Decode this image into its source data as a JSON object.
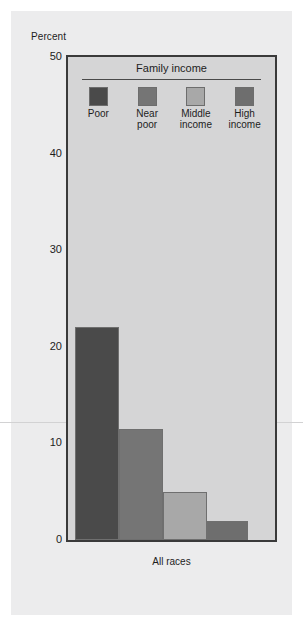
{
  "chart_data": {
    "type": "bar",
    "title": "",
    "legend_title": "Family income",
    "legend_position": "inside-top",
    "xlabel": "All races",
    "ylabel": "Percent",
    "ylim": [
      0,
      50
    ],
    "yticks": [
      50,
      40,
      30,
      20,
      10,
      0
    ],
    "grid": false,
    "categories": [
      "All races"
    ],
    "series": [
      {
        "name": "Poor",
        "values": [
          22.0
        ],
        "color": "#4a4a4a"
      },
      {
        "name": "Near poor",
        "values": [
          11.5
        ],
        "color": "#757575"
      },
      {
        "name": "Middle income",
        "values": [
          5.0
        ],
        "color": "#a8a8a8"
      },
      {
        "name": "High income",
        "values": [
          2.0
        ],
        "color": "#6e6e6e"
      }
    ]
  },
  "axis": {
    "y_title": "Percent",
    "ticks": [
      {
        "label": "50",
        "value": 50
      },
      {
        "label": "40",
        "value": 40
      },
      {
        "label": "30",
        "value": 30
      },
      {
        "label": "20",
        "value": 20
      },
      {
        "label": "10",
        "value": 10
      },
      {
        "label": "0",
        "value": 0
      }
    ],
    "x_label": "All races"
  },
  "legend": {
    "title": "Family income",
    "items": [
      {
        "label_line1": "Poor",
        "label_line2": "",
        "color": "#4a4a4a"
      },
      {
        "label_line1": "Near",
        "label_line2": "poor",
        "color": "#757575"
      },
      {
        "label_line1": "Middle",
        "label_line2": "income",
        "color": "#a8a8a8"
      },
      {
        "label_line1": "High",
        "label_line2": "income",
        "color": "#6e6e6e"
      }
    ]
  },
  "colors": {
    "page_background": "#ffffff",
    "panel_background": "#ececed",
    "plot_background": "#d5d5d6",
    "plot_border": "#3a3a3a",
    "text": "#1d1d1d"
  }
}
